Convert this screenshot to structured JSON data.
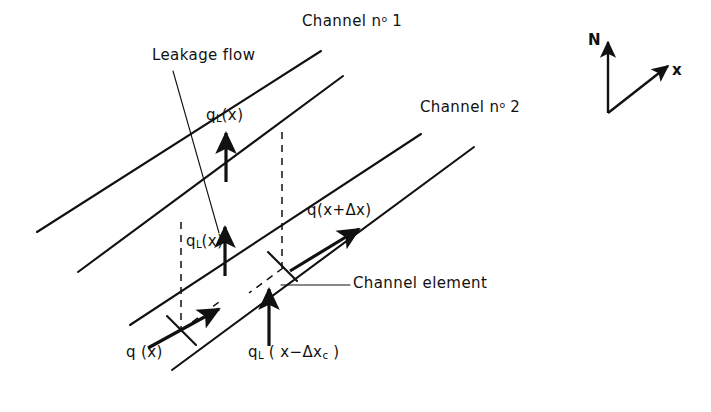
{
  "figure": {
    "type": "technical-line-diagram",
    "background_color": "#ffffff",
    "line_color": "#111111"
  },
  "labels": {
    "channel_1": "Channel nº 1",
    "channel_1_text": "Channel n",
    "channel_1_sup": "o",
    "channel_1_num": "1",
    "channel_2_text": "Channel n",
    "channel_2_sup": "o",
    "channel_2_num": "2",
    "leakage_flow": "Leakage flow",
    "channel_element": "Channel element",
    "q_l_upper": "q",
    "q_l_upper_sub": "L",
    "q_l_upper_arg": "(x)",
    "q_l_lower": "q",
    "q_l_lower_sub": "L",
    "q_l_lower_arg": "(x)",
    "q_x_plus_dx": "q(x+Δx)",
    "q_x": "q (x)",
    "q_l_bottom": "q",
    "q_l_bottom_sub": "L",
    "q_l_bottom_arg_open": " ( x−Δx",
    "q_l_bottom_arg_sub": "c",
    "q_l_bottom_arg_close": " )"
  },
  "axes_indicator": {
    "north_label": "N",
    "x_label": "x",
    "origin": [
      608,
      113
    ],
    "north_tip": [
      608,
      38
    ],
    "x_tip": [
      672,
      63
    ]
  },
  "geometry": {
    "channel_walls": [
      {
        "name": "wall-1-outer",
        "from": [
          37,
          232
        ],
        "to": [
          321,
          51
        ]
      },
      {
        "name": "wall-1-inner",
        "from": [
          78,
          272
        ],
        "to": [
          343,
          76
        ]
      },
      {
        "name": "wall-2-outer",
        "from": [
          130,
          325
        ],
        "to": [
          421,
          134
        ]
      },
      {
        "name": "wall-2-inner",
        "from": [
          172,
          370
        ],
        "to": [
          474,
          147
        ]
      }
    ],
    "leakage_arrows": [
      {
        "name": "q-l-upper-arrow",
        "from": [
          226,
          181
        ],
        "to": [
          226,
          130
        ]
      },
      {
        "name": "q-l-lower-arrow",
        "from": [
          225,
          275
        ],
        "to": [
          225,
          224
        ]
      },
      {
        "name": "q-l-bottom-arrow",
        "from": [
          269,
          345
        ],
        "to": [
          269,
          286
        ]
      }
    ],
    "flow_arrows": [
      {
        "name": "q-x-arrow",
        "from": [
          148,
          348
        ],
        "to": [
          222,
          307
        ]
      },
      {
        "name": "q-x-plus-dx-arrow",
        "from": [
          290,
          270
        ],
        "to": [
          362,
          227
        ]
      }
    ],
    "dashed_vertical_links": [
      {
        "name": "dash-left-vertical",
        "from": [
          181,
          222
        ],
        "to": [
          181,
          330
        ]
      },
      {
        "name": "dash-right-vertical",
        "from": [
          282,
          132
        ],
        "to": [
          282,
          268
        ]
      }
    ],
    "dashed_cross_links": [
      {
        "name": "dash-cross-upper",
        "from": [
          282,
          268
        ],
        "to": [
          250,
          292
        ]
      },
      {
        "name": "dash-cross-lower",
        "from": [
          181,
          330
        ],
        "to": [
          218,
          302
        ]
      }
    ],
    "tick_marks": [
      {
        "name": "tick-upper",
        "from": [
          268,
          253
        ],
        "to": [
          296,
          280
        ]
      },
      {
        "name": "tick-lower",
        "from": [
          167,
          317
        ],
        "to": [
          196,
          344
        ]
      }
    ],
    "leader_lines": [
      {
        "name": "leakage-flow-leader",
        "from": [
          173,
          71
        ],
        "to": [
          219,
          232
        ]
      },
      {
        "name": "channel-element-leader",
        "from": [
          280,
          285
        ],
        "to": [
          348,
          285
        ]
      }
    ]
  }
}
